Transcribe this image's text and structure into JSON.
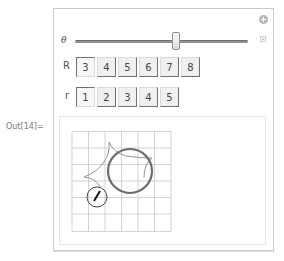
{
  "cell": {
    "out_label": "Out[14]="
  },
  "manipulate": {
    "slider": {
      "label": "θ",
      "value_fraction": 0.56
    },
    "R": {
      "label": "R",
      "options": [
        "3",
        "4",
        "5",
        "6",
        "7",
        "8"
      ],
      "selected": "3"
    },
    "r": {
      "label": "r",
      "options": [
        "1",
        "2",
        "3",
        "4",
        "5"
      ],
      "selected": "1"
    },
    "icons": {
      "add": "plus-circle-icon",
      "expand": "small-plus-icon"
    }
  },
  "plot": {
    "grid": {
      "x_lines": 7,
      "y_lines": 7,
      "cell_px": 16.5,
      "origin_px": [
        72,
        131.5
      ]
    },
    "big_circle": {
      "cx": 130,
      "cy": 171,
      "r": 22,
      "color": "#6b6b6b"
    },
    "small_circle": {
      "cx": 97,
      "cy": 197,
      "r": 10,
      "color": "#444444"
    },
    "curve_color": "#8a8a8a",
    "grid_color": "#c8c8c8"
  }
}
